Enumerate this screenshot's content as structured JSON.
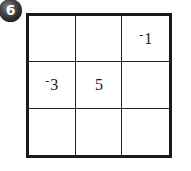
{
  "badge": {
    "number": "6",
    "color": "#1e1e1e"
  },
  "grid": {
    "rows": 3,
    "cols": 3,
    "cells": [
      [
        {
          "sign": "",
          "value": ""
        },
        {
          "sign": "",
          "value": ""
        },
        {
          "sign": "-",
          "value": "1"
        }
      ],
      [
        {
          "sign": "-",
          "value": "3"
        },
        {
          "sign": "",
          "value": "5"
        },
        {
          "sign": "",
          "value": ""
        }
      ],
      [
        {
          "sign": "",
          "value": ""
        },
        {
          "sign": "",
          "value": ""
        },
        {
          "sign": "",
          "value": ""
        }
      ]
    ],
    "line_color": "#1a1a1a"
  }
}
